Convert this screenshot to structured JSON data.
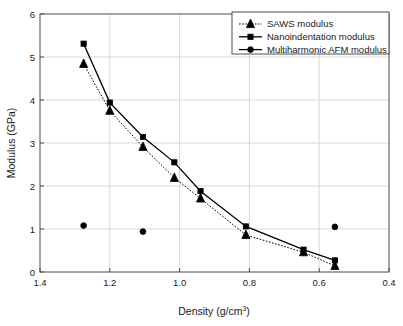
{
  "chart_data": {
    "type": "line",
    "title": "",
    "xlabel": "Density (g/cm3)",
    "xlabel_base": "Density (g/cm",
    "xlabel_sup": "3",
    "xlabel_tail": ")",
    "ylabel": "Modulus (GPa)",
    "xlim": [
      1.4,
      0.4
    ],
    "ylim": [
      0,
      6
    ],
    "x_reversed": true,
    "grid": true,
    "legend_position": "top-right",
    "xticks": [
      1.4,
      1.2,
      1.0,
      0.8,
      0.6,
      0.4
    ],
    "xtick_labels": [
      "1.4",
      "1.2",
      "1.0",
      "0.8",
      "0.6",
      "0.4"
    ],
    "yticks": [
      0,
      1,
      2,
      3,
      4,
      5,
      6
    ],
    "ytick_labels": [
      "0",
      "1",
      "2",
      "3",
      "4",
      "5",
      "6"
    ],
    "series": [
      {
        "name": "SAWS modulus",
        "marker": "triangle",
        "line": "dotted",
        "color": "#000000",
        "x": [
          1.275,
          1.2,
          1.105,
          1.015,
          0.94,
          0.81,
          0.645,
          0.555
        ],
        "y": [
          4.84,
          3.75,
          2.91,
          2.19,
          1.71,
          0.86,
          0.46,
          0.14
        ]
      },
      {
        "name": "Nanoindentation modulus",
        "marker": "square",
        "line": "solid",
        "color": "#000000",
        "x": [
          1.275,
          1.2,
          1.105,
          1.015,
          0.94,
          0.81,
          0.645,
          0.555
        ],
        "y": [
          5.31,
          3.94,
          3.14,
          2.55,
          1.88,
          1.06,
          0.52,
          0.27
        ]
      },
      {
        "name": "Multiharmonic AFM modulus",
        "marker": "circle",
        "line": "none",
        "color": "#000000",
        "x": [
          1.275,
          1.105,
          0.555
        ],
        "y": [
          1.08,
          0.94,
          1.05
        ]
      }
    ]
  },
  "legend": {
    "entries": [
      {
        "label": "SAWS modulus",
        "marker": "triangle",
        "line": "dotted"
      },
      {
        "label": "Nanoindentation modulus",
        "marker": "square",
        "line": "solid"
      },
      {
        "label": "Multiharmonic AFM modulus",
        "marker": "circle",
        "line": "solid"
      }
    ]
  },
  "style": {
    "axis_color": "#4d4d4d",
    "grid_color": "#d9d9d9",
    "marker_color": "#000000",
    "background": "#ffffff"
  }
}
